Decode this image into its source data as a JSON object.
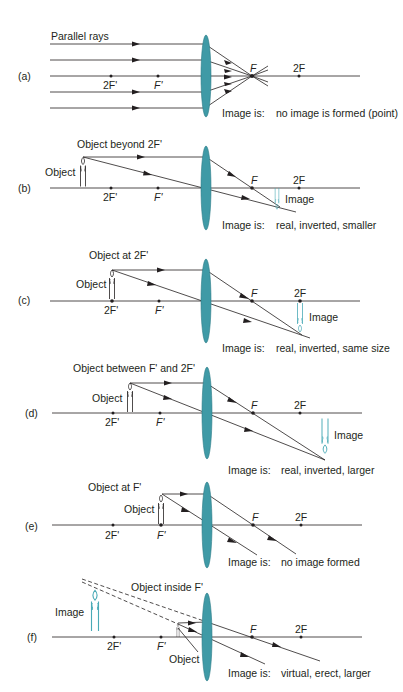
{
  "diagram": {
    "lens_color": "#3f9aa6",
    "image_color": "#4aaab6",
    "line_color": "#231f20",
    "image_is_label": "Image is:",
    "focal_labels": {
      "F": "F",
      "two_F": "2F",
      "F_prime": "F'",
      "two_F_prime": "2F'"
    },
    "panels": [
      {
        "id": "a",
        "tag": "(a)",
        "caption": "Parallel rays",
        "object_label": "",
        "image_label": "",
        "result": "no image is formed (point)"
      },
      {
        "id": "b",
        "tag": "(b)",
        "caption": "Object beyond 2F'",
        "object_label": "Object",
        "image_label": "Image",
        "result": "real, inverted, smaller"
      },
      {
        "id": "c",
        "tag": "(c)",
        "caption": "Object at 2F'",
        "object_label": "Object",
        "image_label": "Image",
        "result": "real, inverted, same size"
      },
      {
        "id": "d",
        "tag": "(d)",
        "caption": "Object between F' and 2F'",
        "object_label": "Object",
        "image_label": "Image",
        "result": "real, inverted, larger"
      },
      {
        "id": "e",
        "tag": "(e)",
        "caption": "Object at F'",
        "object_label": "Object",
        "image_label": "",
        "result": "no image formed"
      },
      {
        "id": "f",
        "tag": "(f)",
        "caption": "Object inside F'",
        "object_label": "Object",
        "image_label": "Image",
        "result": "virtual, erect, larger"
      }
    ]
  }
}
